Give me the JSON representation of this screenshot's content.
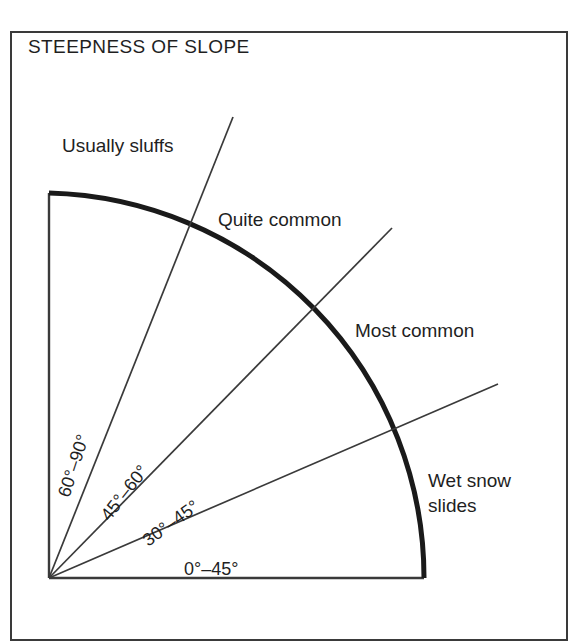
{
  "figure": {
    "title": "STEEPNESS OF SLOPE",
    "frame_color": "#3a3a3a",
    "background_color": "#ffffff",
    "line_color": "#3a3a3a",
    "arc_color": "#1a1a1a",
    "text_color": "#1f1f1f"
  },
  "zone_labels": [
    {
      "text": "Usually sluffs",
      "x": 62,
      "y": 133
    },
    {
      "text": "Quite common",
      "x": 218,
      "y": 207
    },
    {
      "text": "Most common",
      "x": 355,
      "y": 318
    },
    {
      "text": "Wet snow\nslides",
      "x": 428,
      "y": 468
    }
  ],
  "angle_labels": [
    {
      "text": "60°–90°",
      "x": 64,
      "y": 486,
      "rotation": -72
    },
    {
      "text": "45°–60°",
      "x": 105,
      "y": 508,
      "rotation": -52
    },
    {
      "text": "30°–45°",
      "x": 145,
      "y": 532,
      "rotation": -36
    },
    {
      "text": "0°–45°",
      "x": 184,
      "y": 559,
      "rotation": 0
    }
  ],
  "chart_data": {
    "type": "pie",
    "title": "STEEPNESS OF SLOPE",
    "origin": {
      "x": 49,
      "y": 578
    },
    "radius": 378,
    "angle_span_degrees": [
      0,
      90
    ],
    "sectors": [
      {
        "label": "60°–90°",
        "range_degrees": [
          60,
          90
        ],
        "behaviour": "Usually sluffs"
      },
      {
        "label": "45°–60°",
        "range_degrees": [
          45,
          60
        ],
        "behaviour": "Quite common"
      },
      {
        "label": "30°–45°",
        "range_degrees": [
          30,
          45
        ],
        "behaviour": "Most common"
      },
      {
        "label": "0°–45°",
        "range_degrees": [
          0,
          30
        ],
        "behaviour": "Wet snow slides"
      }
    ],
    "divider_rays_degrees": [
      60,
      45,
      30
    ],
    "axes": [
      "vertical-left-edge",
      "horizontal-bottom-edge"
    ],
    "grid": false,
    "legend": "none"
  }
}
